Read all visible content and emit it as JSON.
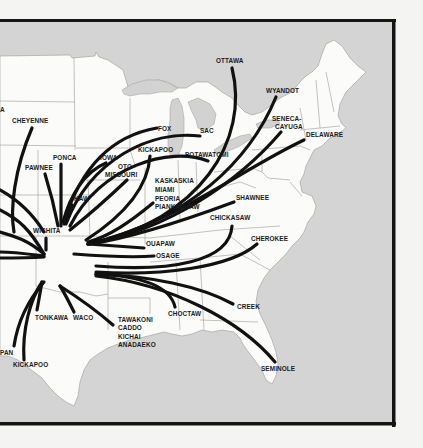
{
  "map": {
    "title": "",
    "subject": "Removal routes of Native American nations to Indian Territory",
    "colors": {
      "page": "#f4f4f2",
      "water": "#d4d4d4",
      "land": "#fbfbfa",
      "state_lines": "#9a9a9a",
      "routes": "#111111",
      "frame": "#151515",
      "labels": "#1a1a1a"
    },
    "labels": [
      {
        "id": "cheyenne",
        "text": "CHEYENNE",
        "x": 12,
        "y": 123
      },
      {
        "id": "ponca",
        "text": "PONCA",
        "x": 53,
        "y": 160
      },
      {
        "id": "pawnee",
        "text": "PAWNEE",
        "x": 25,
        "y": 170
      },
      {
        "id": "iowa",
        "text": "IOWA",
        "x": 100,
        "y": 160
      },
      {
        "id": "oto-missouri-1",
        "text": "OTO-",
        "x": 118,
        "y": 169
      },
      {
        "id": "oto-missouri-2",
        "text": "MISSOURI",
        "x": 105,
        "y": 177
      },
      {
        "id": "kaw",
        "text": "KAW",
        "x": 74,
        "y": 201
      },
      {
        "id": "wichita",
        "text": "WICHITA",
        "x": 33,
        "y": 233
      },
      {
        "id": "fox",
        "text": "FOX",
        "x": 158,
        "y": 131
      },
      {
        "id": "sac",
        "text": "SAC",
        "x": 200,
        "y": 133
      },
      {
        "id": "kickapoo-north",
        "text": "KICKAPOO",
        "x": 138,
        "y": 152
      },
      {
        "id": "potawatomi",
        "text": "POTAWATOMI",
        "x": 185,
        "y": 157
      },
      {
        "id": "kaskaskia",
        "text": "KASKASKIA",
        "x": 155,
        "y": 183
      },
      {
        "id": "miami",
        "text": "MIAMI",
        "x": 155,
        "y": 192
      },
      {
        "id": "peoria",
        "text": "PEORIA",
        "x": 155,
        "y": 201
      },
      {
        "id": "piankashaw",
        "text": "PIANKASHAW",
        "x": 155,
        "y": 209
      },
      {
        "id": "ottawa",
        "text": "OTTAWA",
        "x": 216,
        "y": 63
      },
      {
        "id": "wyandot",
        "text": "WYANDOT",
        "x": 266,
        "y": 93
      },
      {
        "id": "seneca-cayuga-1",
        "text": "SENECA-",
        "x": 272,
        "y": 121
      },
      {
        "id": "seneca-cayuga-2",
        "text": "CAYUGA",
        "x": 275,
        "y": 129
      },
      {
        "id": "delaware",
        "text": "DELAWARE",
        "x": 306,
        "y": 137
      },
      {
        "id": "shawnee",
        "text": "SHAWNEE",
        "x": 236,
        "y": 200
      },
      {
        "id": "chickasaw",
        "text": "CHICKASAW",
        "x": 210,
        "y": 220
      },
      {
        "id": "ouapaw",
        "text": "OUAPAW",
        "x": 146,
        "y": 246
      },
      {
        "id": "osage",
        "text": "OSAGE",
        "x": 156,
        "y": 258
      },
      {
        "id": "cherokee",
        "text": "CHEROKEE",
        "x": 251,
        "y": 241
      },
      {
        "id": "choctaw",
        "text": "CHOCTAW",
        "x": 168,
        "y": 316
      },
      {
        "id": "creek",
        "text": "CREEK",
        "x": 237,
        "y": 309
      },
      {
        "id": "seminole",
        "text": "SEMINOLE",
        "x": 261,
        "y": 371
      },
      {
        "id": "tonkawa",
        "text": "TONKAWA",
        "x": 35,
        "y": 320
      },
      {
        "id": "waco",
        "text": "WACO",
        "x": 73,
        "y": 320
      },
      {
        "id": "tawakoni",
        "text": "TAWAKONI",
        "x": 118,
        "y": 322
      },
      {
        "id": "caddo",
        "text": "CADDO",
        "x": 118,
        "y": 330
      },
      {
        "id": "kichai",
        "text": "KICHAI",
        "x": 118,
        "y": 339
      },
      {
        "id": "anadaeko",
        "text": "ANADAEKO",
        "x": 118,
        "y": 347
      },
      {
        "id": "lipan",
        "text": "PAN",
        "x": 0,
        "y": 355
      },
      {
        "id": "kickapoo-south",
        "text": "KICKAPOO",
        "x": 13,
        "y": 367
      },
      {
        "id": "edge-label",
        "text": "A",
        "x": 0,
        "y": 112
      }
    ]
  }
}
